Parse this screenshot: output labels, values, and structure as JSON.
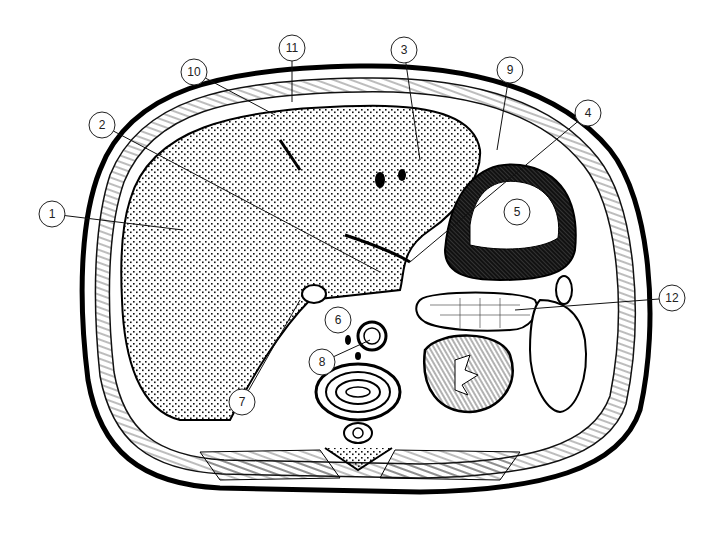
{
  "figure": {
    "background": "#ffffff",
    "ink_color": "#111111",
    "callouts": [
      {
        "id": "1",
        "cx": 52,
        "cy": 214,
        "tx": 183,
        "ty": 230
      },
      {
        "id": "2",
        "cx": 102,
        "cy": 125,
        "tx": 380,
        "ty": 272
      },
      {
        "id": "3",
        "cx": 404,
        "cy": 50,
        "tx": 420,
        "ty": 160
      },
      {
        "id": "4",
        "cx": 588,
        "cy": 113,
        "tx": 410,
        "ty": 262
      },
      {
        "id": "5",
        "cx": 517,
        "cy": 212,
        "tx": null,
        "ty": null
      },
      {
        "id": "6",
        "cx": 338,
        "cy": 320,
        "tx": null,
        "ty": null
      },
      {
        "id": "7",
        "cx": 242,
        "cy": 402,
        "tx": 300,
        "ty": 300
      },
      {
        "id": "8",
        "cx": 322,
        "cy": 362,
        "tx": 370,
        "ty": 340
      },
      {
        "id": "9",
        "cx": 510,
        "cy": 70,
        "tx": 497,
        "ty": 150
      },
      {
        "id": "10",
        "cx": 194,
        "cy": 72,
        "tx": 275,
        "ty": 115
      },
      {
        "id": "11",
        "cx": 292,
        "cy": 48,
        "tx": 292,
        "ty": 102
      },
      {
        "id": "12",
        "cx": 672,
        "cy": 298,
        "tx": 515,
        "ty": 310
      }
    ]
  }
}
